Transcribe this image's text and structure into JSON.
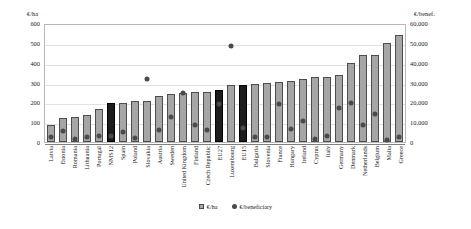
{
  "chart_data": {
    "type": "bar",
    "title": "",
    "subtitle": "",
    "xlabel": "",
    "ylabel": "€/ha",
    "y2label": "€/benef.",
    "ylim": [
      0,
      600
    ],
    "y2lim": [
      0,
      60000
    ],
    "grid": true,
    "legend_position": "bottom",
    "left_axis_title": "€/ha",
    "right_axis_title": "€/benef.",
    "left_ticks": [
      "600",
      "500",
      "400",
      "300",
      "200",
      "100",
      "0"
    ],
    "right_ticks": [
      "60,000",
      "50,000",
      "40,000",
      "30,000",
      "20,000",
      "10,000",
      "0"
    ],
    "left_tick_values": [
      600,
      500,
      400,
      300,
      200,
      100,
      0
    ],
    "right_tick_values": [
      60000,
      50000,
      40000,
      30000,
      20000,
      10000,
      0
    ],
    "categories": [
      "Latvia",
      "Estonia",
      "Romania",
      "Lithuania",
      "Portugal",
      "NMS12",
      "Spain",
      "Poland",
      "Slovakia",
      "Austria",
      "Sweden",
      "United Kingdom",
      "Finland",
      "Czech Republic",
      "EU27",
      "Luxembourg",
      "EU15",
      "Bulgaria",
      "Slovenia",
      "France",
      "Hungary",
      "Ireland",
      "Cyprus",
      "Italy",
      "Germany",
      "Denmark",
      "Netherlands",
      "Belgium",
      "Malta",
      "Greece"
    ],
    "highlight_categories": [
      "NMS12",
      "EU27",
      "EU15"
    ],
    "series": [
      {
        "name": "€/ha",
        "axis": "left",
        "type": "bar",
        "values": [
          85,
          122,
          128,
          136,
          165,
          195,
          196,
          205,
          207,
          230,
          240,
          248,
          252,
          253,
          262,
          287,
          287,
          295,
          296,
          304,
          307,
          316,
          327,
          329,
          339,
          399,
          437,
          441,
          497,
          542
        ]
      },
      {
        "name": "€/beneficiary",
        "axis": "right",
        "type": "scatter",
        "values": [
          2400,
          5600,
          1500,
          2400,
          3000,
          3200,
          5200,
          2200,
          32000,
          5900,
          12800,
          24600,
          8500,
          6300,
          19000,
          48200,
          7300,
          2500,
          2700,
          19400,
          6700,
          10500,
          1400,
          2900,
          17400,
          19700,
          8800,
          14100,
          1100,
          2400
        ]
      }
    ],
    "legend": [
      {
        "label": "€/ha",
        "marker": "square",
        "color": "#a6a6a6"
      },
      {
        "label": "€/beneficiary",
        "marker": "circle",
        "color": "#4a4a4a"
      }
    ]
  }
}
